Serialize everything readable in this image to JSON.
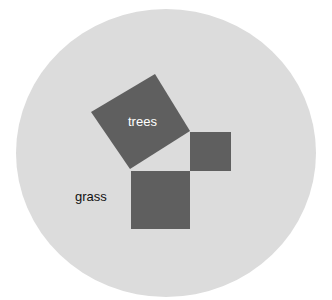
{
  "diagram": {
    "type": "pythagorean-squares-on-circle",
    "colors": {
      "background": "#ffffff",
      "circle": "#dcdcdc",
      "squares": "#5f5f5f",
      "label_on_square": "#ffffff",
      "label_on_circle": "#111111"
    },
    "circle": {
      "cx": 166,
      "cy": 153,
      "rx": 150,
      "ry": 144
    },
    "shapes": {
      "tilted_square": {
        "points": "155,74 190,131 130,169 91,112",
        "label": "trees"
      },
      "small_square": {
        "x": 190,
        "y": 132,
        "width": 41,
        "height": 39
      },
      "large_square": {
        "x": 131,
        "y": 171,
        "width": 59,
        "height": 58
      }
    },
    "labels": {
      "trees": "trees",
      "grass": "grass"
    }
  }
}
